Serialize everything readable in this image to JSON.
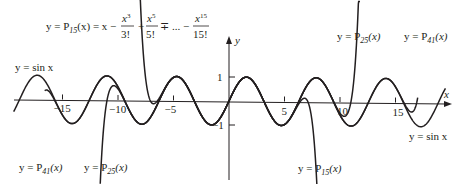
{
  "chart_data": {
    "type": "line",
    "title": "",
    "xlabel": "x",
    "ylabel": "y",
    "xlim": [
      -19.5,
      19.5
    ],
    "ylim": [
      -3.5,
      4
    ],
    "grid": false,
    "legend": "inline labels",
    "x_ticks": [
      -15,
      -10,
      -5,
      5,
      10,
      15
    ],
    "x_tick_labels": [
      "−15",
      "−10",
      "−5",
      "5",
      "10",
      "15"
    ],
    "y_ticks": [
      1,
      -1
    ],
    "y_tick_labels": [
      "1",
      "−1"
    ],
    "series": [
      {
        "name": "y = sin x",
        "function": "sin(x)",
        "domain": [
          -19.4,
          19.5
        ]
      },
      {
        "name": "y = P15(x)",
        "function": "Taylor polynomial of sin x, degree 15",
        "degree": 15,
        "domain": [
          -8.6,
          8.9
        ]
      },
      {
        "name": "y = P25(x)",
        "function": "Taylor polynomial of sin x, degree 25",
        "degree": 25,
        "domain": [
          -11.6,
          11.8
        ]
      },
      {
        "name": "y = P41(x)",
        "function": "Taylor polynomial of sin x, degree 41",
        "degree": 41,
        "domain": [
          -16.6,
          17.0
        ]
      }
    ],
    "annotations": [
      {
        "text": "y = P15(x) = x − x^3/3! + x^5/5! ∓ ... − x^15/15!",
        "position": "top-left"
      },
      {
        "text": "y = sin x",
        "position": "upper-left"
      },
      {
        "text": "y = P25(x)",
        "position": "top-right"
      },
      {
        "text": "y = P41(x)",
        "position": "top-right"
      },
      {
        "text": "y = P41(x)",
        "position": "bottom-left"
      },
      {
        "text": "y = P25(x)",
        "position": "bottom-left"
      },
      {
        "text": "y = P15(x)",
        "position": "bottom-center"
      },
      {
        "text": "y = sin x",
        "position": "bottom-right"
      }
    ]
  },
  "axes": {
    "x_label": "x",
    "y_label": "y",
    "ticks_x": [
      {
        "value": -15,
        "label": "−15"
      },
      {
        "value": -10,
        "label": "−10"
      },
      {
        "value": -5,
        "label": "−5"
      },
      {
        "value": 5,
        "label": "5"
      },
      {
        "value": 10,
        "label": "10"
      },
      {
        "value": 15,
        "label": "15"
      }
    ],
    "ticks_y": [
      {
        "value": 1,
        "label": "1"
      },
      {
        "value": -1,
        "label": "−1"
      }
    ]
  },
  "labels": {
    "formula_lhs": "y = P",
    "formula_sub": "15",
    "formula_mid": "(x) = x −",
    "frac1_num": "x",
    "frac1_sup": "3",
    "frac1_den": "3!",
    "plus": "+",
    "frac2_num": "x",
    "frac2_sup": "5",
    "frac2_den": "5!",
    "mp": "∓ ... −",
    "frac3_num": "x",
    "frac3_sup": "15",
    "frac3_den": "15!",
    "sin_top_left": "y = sin x",
    "sin_bottom_right": "y = sin x",
    "p25_top": "y = P",
    "p25_top_sub": "25",
    "p41_top": "y = P",
    "p41_top_sub": "41",
    "p41_bottom": "y = P",
    "p41_bottom_sub": "41",
    "p25_bottom": "y = P",
    "p25_bottom_sub": "25",
    "p15_bottom": "y = P",
    "p15_bottom_sub": "15",
    "arg": "(x)"
  },
  "style": {
    "curve_color": "#231f20",
    "axis_color": "#231f20"
  }
}
